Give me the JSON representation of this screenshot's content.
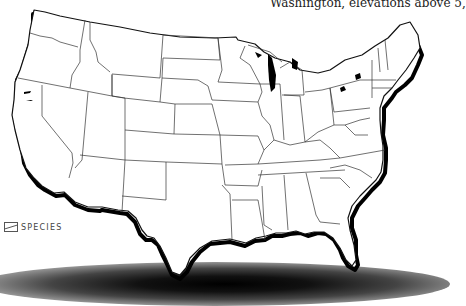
{
  "caption": {
    "text": "Washington, elevations above 5,"
  },
  "map": {
    "title": "Contiguous United States",
    "land_color": "#ffffff",
    "border_color": "#222222",
    "coast_color": "#000000",
    "shadow_color": "#000000"
  },
  "logo": {
    "icon": "species-logo-icon",
    "text": "SPECIES"
  }
}
